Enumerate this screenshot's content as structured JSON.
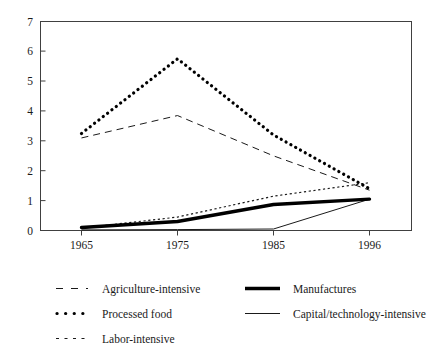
{
  "chart_data": {
    "type": "line",
    "title": "",
    "subtitle": "",
    "xlabel": "",
    "ylabel": "",
    "categories": [
      "1965",
      "1975",
      "1985",
      "1996"
    ],
    "x": [
      1965,
      1975,
      1985,
      1996
    ],
    "xlim": [
      1962,
      2001
    ],
    "ylim": [
      0,
      7
    ],
    "ytick_labels": [
      "0",
      "1",
      "2",
      "3",
      "4",
      "5",
      "6",
      "7"
    ],
    "ytick_values": [
      0,
      1,
      2,
      3,
      4,
      5,
      6,
      7
    ],
    "xtick_labels": [
      "1965",
      "1975",
      "1985",
      "1996"
    ],
    "grid": false,
    "legend_position": "below",
    "series": [
      {
        "name": "Agriculture-intensive",
        "style": "long-dashed",
        "values": [
          3.1,
          3.85,
          2.5,
          1.35
        ]
      },
      {
        "name": "Processed food",
        "style": "thick-dotted",
        "values": [
          3.25,
          5.75,
          3.2,
          1.4
        ]
      },
      {
        "name": "Labor-intensive",
        "style": "short-dashed",
        "values": [
          0.08,
          0.45,
          1.15,
          1.6
        ]
      },
      {
        "name": "Manufactures",
        "style": "thick-solid",
        "values": [
          0.1,
          0.3,
          0.87,
          1.05
        ]
      },
      {
        "name": "Capital/technology-intensive",
        "style": "thin-solid",
        "values": [
          0.02,
          0.03,
          0.05,
          1.05
        ]
      }
    ]
  },
  "legend": {
    "entries": [
      {
        "label": "Agriculture-intensive",
        "style": "long-dashed"
      },
      {
        "label": "Manufactures",
        "style": "thick-solid"
      },
      {
        "label": "Processed food",
        "style": "thick-dotted"
      },
      {
        "label": "Capital/technology-intensive",
        "style": "thin-solid"
      },
      {
        "label": "Labor-intensive",
        "style": "short-dashed"
      }
    ]
  },
  "colors": {
    "ink": "#111111",
    "axis": "#404040",
    "background": "#ffffff"
  }
}
